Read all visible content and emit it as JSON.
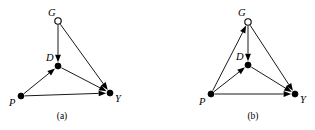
{
  "figure": {
    "background_color": "#ffffff",
    "stroke_color": "#000000",
    "width": 315,
    "height": 130
  },
  "panels": [
    {
      "id": "a",
      "caption": "(a)",
      "caption_pos": {
        "x": 62,
        "y": 119
      },
      "nodes": [
        {
          "id": "G",
          "label": "G",
          "style": "hollow",
          "x": 58,
          "y": 21,
          "r": 3.2,
          "label_x": 48,
          "label_y": 16
        },
        {
          "id": "D",
          "label": "D",
          "style": "filled",
          "x": 58,
          "y": 66,
          "r": 3.0,
          "label_x": 46,
          "label_y": 61
        },
        {
          "id": "P",
          "label": "P",
          "style": "filled",
          "x": 21,
          "y": 96,
          "r": 3.0,
          "label_x": 9,
          "label_y": 106
        },
        {
          "id": "Y",
          "label": "Y",
          "style": "filled",
          "x": 110,
          "y": 93,
          "r": 3.0,
          "label_x": 115,
          "label_y": 102
        }
      ],
      "edges": [
        {
          "from": "G",
          "to": "D",
          "name": "edge-g-to-d"
        },
        {
          "from": "G",
          "to": "Y",
          "name": "edge-g-to-y"
        },
        {
          "from": "P",
          "to": "D",
          "name": "edge-p-to-d"
        },
        {
          "from": "P",
          "to": "Y",
          "name": "edge-p-to-y"
        },
        {
          "from": "D",
          "to": "Y",
          "name": "edge-d-to-y"
        }
      ]
    },
    {
      "id": "b",
      "caption": "(b)",
      "caption_pos": {
        "x": 253,
        "y": 119
      },
      "nodes": [
        {
          "id": "G",
          "label": "G",
          "style": "hollow",
          "x": 248,
          "y": 22,
          "r": 3.2,
          "label_x": 238,
          "label_y": 16
        },
        {
          "id": "D",
          "label": "D",
          "style": "filled",
          "x": 248,
          "y": 65,
          "r": 3.0,
          "label_x": 236,
          "label_y": 60
        },
        {
          "id": "P",
          "label": "P",
          "style": "filled",
          "x": 211,
          "y": 94,
          "r": 3.0,
          "label_x": 199,
          "label_y": 105
        },
        {
          "id": "Y",
          "label": "Y",
          "style": "filled",
          "x": 295,
          "y": 94,
          "r": 3.0,
          "label_x": 300,
          "label_y": 103
        }
      ],
      "edges": [
        {
          "from": "P",
          "to": "G",
          "name": "edge-p-to-g"
        },
        {
          "from": "G",
          "to": "D",
          "name": "edge-g-to-d"
        },
        {
          "from": "G",
          "to": "Y",
          "name": "edge-g-to-y"
        },
        {
          "from": "P",
          "to": "D",
          "name": "edge-p-to-d"
        },
        {
          "from": "P",
          "to": "Y",
          "name": "edge-p-to-y"
        },
        {
          "from": "D",
          "to": "Y",
          "name": "edge-d-to-y"
        }
      ]
    }
  ],
  "arrow": {
    "length": 7.5,
    "half_width": 2.9,
    "gap_from_target": 3.4,
    "gap_from_source": 3.4
  }
}
